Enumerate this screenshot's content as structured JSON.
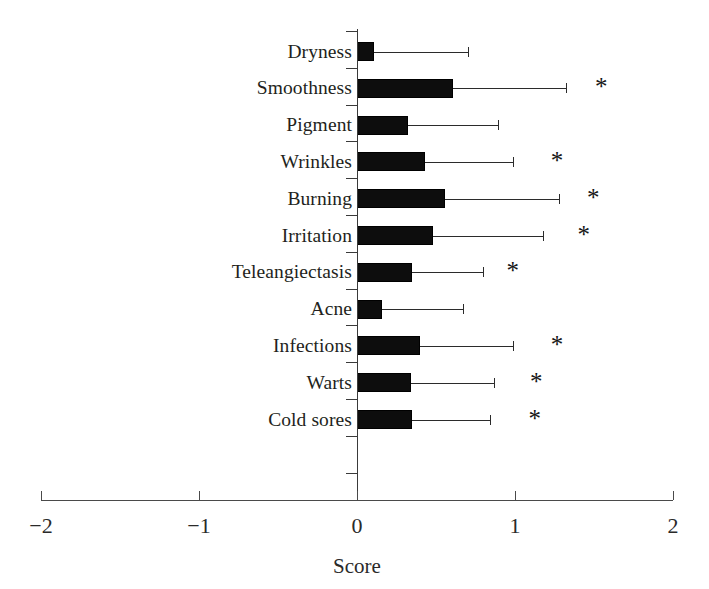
{
  "chart_data": {
    "type": "bar",
    "orientation": "horizontal",
    "title": "",
    "xlabel": "Score",
    "ylabel": "",
    "xlim": [
      -2,
      2
    ],
    "xticks": [
      -2,
      -1,
      0,
      1,
      2
    ],
    "xticklabels": [
      "−2",
      "−1",
      "0",
      "1",
      "2"
    ],
    "grid": false,
    "legend": null,
    "error_bar_style": "upper-only",
    "significance_marker": "*",
    "categories": [
      "Dryness",
      "Smoothness",
      "Pigment",
      "Wrinkles",
      "Burning",
      "Irritation",
      "Teleangiectasis",
      "Acne",
      "Infections",
      "Warts",
      "Cold sores"
    ],
    "values": [
      0.11,
      0.61,
      0.32,
      0.43,
      0.56,
      0.48,
      0.35,
      0.16,
      0.4,
      0.34,
      0.35
    ],
    "error_upper": [
      0.7,
      1.32,
      0.89,
      0.99,
      1.28,
      1.18,
      0.8,
      0.67,
      0.99,
      0.87,
      0.84
    ],
    "significant": [
      false,
      true,
      false,
      true,
      true,
      true,
      true,
      false,
      true,
      true,
      true
    ],
    "star_positions": [
      null,
      1.55,
      null,
      1.27,
      1.5,
      1.44,
      0.99,
      null,
      1.27,
      1.14,
      1.13
    ],
    "bar_color": "#0d0d0d",
    "error_color": "#2b2b2b",
    "axis_color": "#3a3a3a",
    "background_color": "#ffffff",
    "rows": [
      {
        "label": "Dryness",
        "value": 0.11,
        "error_upper": 0.7,
        "star": "",
        "star_x": 0
      },
      {
        "label": "Smoothness",
        "value": 0.61,
        "error_upper": 1.32,
        "star": "*",
        "star_x": 1.55
      },
      {
        "label": "Pigment",
        "value": 0.32,
        "error_upper": 0.89,
        "star": "",
        "star_x": 0
      },
      {
        "label": "Wrinkles",
        "value": 0.43,
        "error_upper": 0.99,
        "star": "*",
        "star_x": 1.27
      },
      {
        "label": "Burning",
        "value": 0.56,
        "error_upper": 1.28,
        "star": "*",
        "star_x": 1.5
      },
      {
        "label": "Irritation",
        "value": 0.48,
        "error_upper": 1.18,
        "star": "*",
        "star_x": 1.44
      },
      {
        "label": "Teleangiectasis",
        "value": 0.35,
        "error_upper": 0.8,
        "star": "*",
        "star_x": 0.99
      },
      {
        "label": "Acne",
        "value": 0.16,
        "error_upper": 0.67,
        "star": "",
        "star_x": 0
      },
      {
        "label": "Infections",
        "value": 0.4,
        "error_upper": 0.99,
        "star": "*",
        "star_x": 1.27
      },
      {
        "label": "Warts",
        "value": 0.34,
        "error_upper": 0.87,
        "star": "*",
        "star_x": 1.14
      },
      {
        "label": "Cold sores",
        "value": 0.35,
        "error_upper": 0.84,
        "star": "*",
        "star_x": 1.13
      }
    ]
  },
  "axis": {
    "x_title": "Score",
    "tick_labels": [
      "−2",
      "−1",
      "0",
      "1",
      "2"
    ]
  }
}
